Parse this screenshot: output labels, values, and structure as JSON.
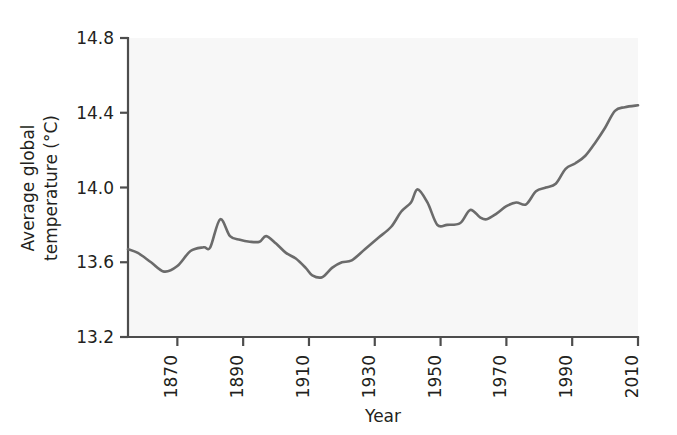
{
  "chart_data": {
    "type": "line",
    "title": "",
    "xlabel": "Year",
    "ylabel": "Average global temperature (°C)",
    "xlim": [
      1855,
      2010
    ],
    "ylim": [
      13.2,
      14.8
    ],
    "xticks": [
      1870,
      1890,
      1910,
      1930,
      1950,
      1970,
      1990,
      2010
    ],
    "xtick_labels": [
      "1870",
      "1890",
      "1910",
      "1930",
      "1950",
      "1970",
      "1990",
      "2010"
    ],
    "yticks": [
      13.2,
      13.6,
      14.0,
      14.4,
      14.8
    ],
    "ytick_labels": [
      "13.2",
      "13.6",
      "14.0",
      "14.4",
      "14.8"
    ],
    "grid": false,
    "legend": null,
    "line_color": "#6b6b6b",
    "plot_background": "#f7f7f7",
    "axis_color": "#4d4d4d",
    "series": [
      {
        "name": "Average global temperature",
        "x": [
          1855,
          1858,
          1862,
          1866,
          1870,
          1874,
          1878,
          1880,
          1883,
          1886,
          1889,
          1892,
          1895,
          1897,
          1900,
          1903,
          1906,
          1909,
          1911,
          1914,
          1917,
          1920,
          1923,
          1927,
          1931,
          1935,
          1938,
          1941,
          1943,
          1946,
          1949,
          1952,
          1956,
          1959,
          1962,
          1964,
          1967,
          1970,
          1973,
          1976,
          1979,
          1982,
          1985,
          1988,
          1991,
          1994,
          1997,
          2000,
          2003,
          2006,
          2010
        ],
        "y": [
          13.67,
          13.65,
          13.6,
          13.55,
          13.58,
          13.66,
          13.68,
          13.68,
          13.83,
          13.74,
          13.72,
          13.71,
          13.71,
          13.74,
          13.7,
          13.65,
          13.62,
          13.57,
          13.53,
          13.52,
          13.57,
          13.6,
          13.61,
          13.67,
          13.73,
          13.79,
          13.87,
          13.92,
          13.99,
          13.92,
          13.8,
          13.8,
          13.81,
          13.88,
          13.84,
          13.83,
          13.86,
          13.9,
          13.92,
          13.91,
          13.98,
          14.0,
          14.02,
          14.1,
          14.13,
          14.17,
          14.24,
          14.32,
          14.41,
          14.43,
          14.44
        ]
      }
    ]
  },
  "axis_labels": {
    "x_title": "Year",
    "y_title_line1": "Average global",
    "y_title_line2": "temperature (°C)"
  }
}
